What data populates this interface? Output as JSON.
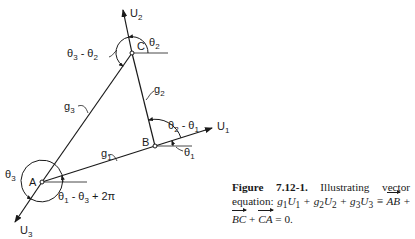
{
  "diagram": {
    "points": {
      "A": {
        "label": "A",
        "x": 42,
        "y": 182
      },
      "B": {
        "label": "B",
        "x": 155,
        "y": 146
      },
      "C": {
        "label": "C",
        "x": 132,
        "y": 53
      }
    },
    "vectors": {
      "U1": {
        "label": "U",
        "sub": "1"
      },
      "U2": {
        "label": "U",
        "sub": "2"
      },
      "U3": {
        "label": "U",
        "sub": "3"
      }
    },
    "sides": {
      "g1": {
        "label": "g",
        "sub": "1"
      },
      "g2": {
        "label": "g",
        "sub": "2"
      },
      "g3": {
        "label": "g",
        "sub": "3"
      }
    },
    "angles": {
      "theta1": {
        "text": "θ",
        "sub": "1"
      },
      "theta2": {
        "text": "θ",
        "sub": "2"
      },
      "theta3": {
        "text": "θ",
        "sub": "3"
      },
      "theta2_minus_theta1": {
        "a": "θ",
        "a_sub": "2",
        "op": " - ",
        "b": "θ",
        "b_sub": "1"
      },
      "theta3_minus_theta2": {
        "a": "θ",
        "a_sub": "3",
        "op": " - ",
        "b": "θ",
        "b_sub": "2"
      },
      "theta1_minus_theta3_plus_2pi": {
        "a": "θ",
        "a_sub": "1",
        "op": " - ",
        "b": "θ",
        "b_sub": "3",
        "tail": " + 2π"
      }
    }
  },
  "caption": {
    "figure_label": "Figure 7.12-1.",
    "text_1": " Illustrating vector equation: ",
    "eq": {
      "g1": "g",
      "g1_sub": "1",
      "U1": "U",
      "U1_sub": "1",
      "plus": " + ",
      "g2": "g",
      "g2_sub": "2",
      "U2": "U",
      "U2_sub": "2",
      "g3": "g",
      "g3_sub": "3",
      "U3": "U",
      "U3_sub": "3",
      "equiv": " ≡ ",
      "AB": "AB",
      "BC": "BC",
      "CA": "CA",
      "equals_zero": " = 0."
    }
  }
}
